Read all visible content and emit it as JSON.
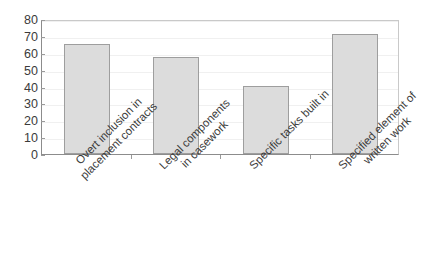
{
  "chart_data": {
    "type": "bar",
    "title": "",
    "subtitle": "",
    "xlabel": "",
    "ylabel": "",
    "ylim": [
      0,
      80
    ],
    "yticks": [
      0,
      10,
      20,
      30,
      40,
      50,
      60,
      70,
      80
    ],
    "ytick_labels": [
      "0",
      "10",
      "20",
      "30",
      "40",
      "50",
      "60",
      "70",
      "80"
    ],
    "grid": true,
    "legend": null,
    "legend_position": "none",
    "bar_fill_color": "#dcdcdc",
    "bar_border_color": "#9e9e9e",
    "categories": [
      "Overt inclusion in placement contracts",
      "Legal components in casework",
      "Specific tasks built in",
      "Specified element of written work"
    ],
    "category_lines": [
      [
        "Overt inclusion in",
        "placement contracts"
      ],
      [
        "Legal components",
        "in casework"
      ],
      [
        "Specific tasks built in",
        ""
      ],
      [
        "Specified element of",
        "written work"
      ]
    ],
    "values": [
      65,
      57.5,
      40.5,
      71
    ]
  }
}
